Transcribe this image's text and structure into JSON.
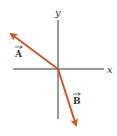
{
  "diagram": {
    "type": "vector-diagram",
    "colors": {
      "axis": "#333333",
      "vector": "#c8582a",
      "background": "#ffffff"
    },
    "axes": {
      "x_label": "x",
      "y_label": "y"
    },
    "vectors": [
      {
        "name": "A",
        "label": "A",
        "direction": "up-left",
        "description": "Vector A points from the origin toward the upper-left"
      },
      {
        "name": "B",
        "label": "B",
        "direction": "down-right (steep)",
        "description": "Vector B points from the origin steeply downward and slightly right"
      }
    ]
  }
}
